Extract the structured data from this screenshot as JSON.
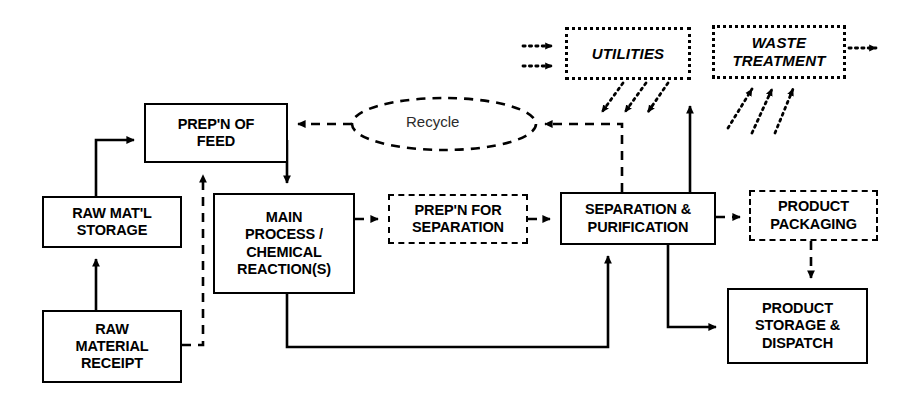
{
  "diagram": {
    "background_color": "#ffffff",
    "line_color": "#000000",
    "nodes": [
      {
        "id": "prepn-of-feed",
        "label": "PREP'N OF\nFEED",
        "style": "solid",
        "x": 144,
        "y": 103,
        "w": 144,
        "h": 60
      },
      {
        "id": "raw-matl-storage",
        "label": "RAW MAT'L\nSTORAGE",
        "style": "solid",
        "x": 42,
        "y": 196,
        "w": 140,
        "h": 52
      },
      {
        "id": "raw-material-receipt",
        "label": "RAW\nMATERIAL\nRECEIPT",
        "style": "solid",
        "x": 42,
        "y": 310,
        "w": 140,
        "h": 73
      },
      {
        "id": "main-process",
        "label": "MAIN\nPROCESS /\nCHEMICAL\nREACTION(S)",
        "style": "solid",
        "x": 213,
        "y": 193,
        "w": 142,
        "h": 101
      },
      {
        "id": "prepn-for-separation",
        "label": "PREP'N FOR\nSEPARATION",
        "style": "dashed",
        "x": 388,
        "y": 194,
        "w": 140,
        "h": 50
      },
      {
        "id": "separation-purification",
        "label": "SEPARATION &\nPURIFICATION",
        "style": "solid",
        "x": 560,
        "y": 192,
        "w": 156,
        "h": 53
      },
      {
        "id": "product-packaging",
        "label": "PRODUCT\nPACKAGING",
        "style": "dashed",
        "x": 749,
        "y": 190,
        "w": 129,
        "h": 51
      },
      {
        "id": "product-storage-dispatch",
        "label": "PRODUCT\nSTORAGE &\nDISPATCH",
        "style": "solid",
        "x": 727,
        "y": 288,
        "w": 141,
        "h": 76
      },
      {
        "id": "utilities",
        "label": "UTILITIES",
        "style": "dotted",
        "x": 565,
        "y": 27,
        "w": 126,
        "h": 53
      },
      {
        "id": "waste-treatment",
        "label": "WASTE\nTREATMENT",
        "style": "dotted",
        "x": 712,
        "y": 25,
        "w": 134,
        "h": 54
      }
    ],
    "recycle": {
      "label": "Recycle",
      "cx": 444,
      "cy": 124,
      "rx": 90,
      "ry": 26
    },
    "connector_count": 22
  }
}
